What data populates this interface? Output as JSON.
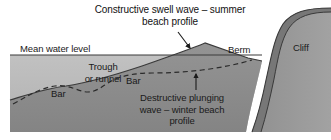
{
  "figure": {
    "kind": "beach-profile-cross-section-diagram",
    "width": 331,
    "height": 140,
    "background": "#ffffff"
  },
  "labels": {
    "title": "Constructive swell wave – summer\nbeach profile",
    "mean_water_level": "Mean water level",
    "trough": "Trough\nor runnel",
    "bar_left": "Bar",
    "bar_mid": "Bar",
    "berm": "Berm",
    "cliff": "Cliff",
    "destructive": "Destructive plunging\nwave – winter beach\nprofile"
  },
  "colors": {
    "water": "#b9b9b9",
    "seabed": "#8d8d8d",
    "cliff_body": "#9a9a9a",
    "cliff_face": "#777777",
    "outline": "#3a3a3a",
    "text": "#1a1a1a",
    "background": "#ffffff"
  },
  "geometry": {
    "mean_water_level_y": 55,
    "summer_crest": {
      "x": 205,
      "y": 43
    },
    "arrow_to_summer_profile": {
      "from_x": 178,
      "from_y": 33,
      "to_x": 190,
      "to_y": 48
    },
    "arrow_to_winter_profile": {
      "from_x": 196,
      "from_y": 89,
      "to_x": 196,
      "to_y": 75
    }
  }
}
